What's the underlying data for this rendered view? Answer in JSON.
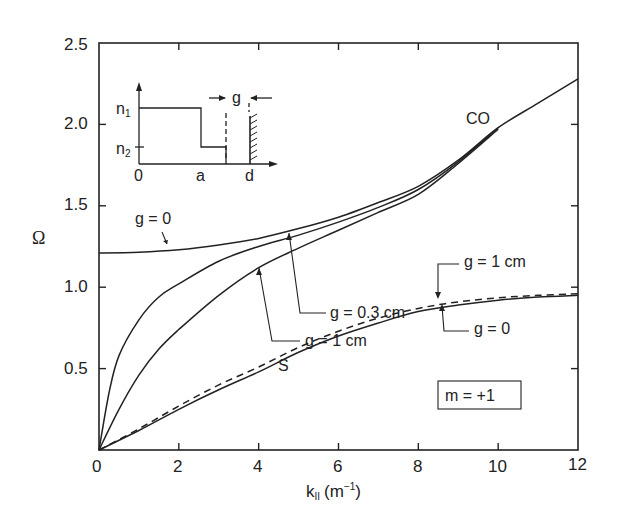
{
  "chart_data": {
    "type": "line",
    "title": "",
    "xlabel": "k∥ (m⁻¹)",
    "ylabel": "Ω",
    "xlim": [
      0,
      12
    ],
    "ylim": [
      0,
      2.5
    ],
    "x_ticks": [
      "0",
      "2",
      "4",
      "6",
      "8",
      "10",
      "12"
    ],
    "y_ticks": [
      "0",
      "0.5",
      "1.0",
      "1.5",
      "2.0",
      "2.5"
    ],
    "grid": false,
    "legend": "none (inline annotations)",
    "series": [
      {
        "name": "CO, g = 0",
        "style": "solid",
        "x": [
          0,
          1,
          2,
          3,
          4,
          5,
          6,
          7,
          8,
          9,
          10,
          11,
          12
        ],
        "y": [
          1.21,
          1.215,
          1.23,
          1.26,
          1.3,
          1.36,
          1.43,
          1.52,
          1.62,
          1.78,
          1.98,
          2.13,
          2.28
        ]
      },
      {
        "name": "CO, g = 0.3 cm",
        "style": "solid",
        "x": [
          0,
          0.25,
          0.5,
          1,
          1.5,
          2,
          3,
          4,
          5,
          6,
          7,
          8,
          9,
          10
        ],
        "y": [
          0,
          0.35,
          0.58,
          0.8,
          0.94,
          1.02,
          1.16,
          1.25,
          1.32,
          1.4,
          1.49,
          1.6,
          1.77,
          1.98
        ]
      },
      {
        "name": "CO, g = 1 cm",
        "style": "solid",
        "x": [
          0,
          0.5,
          1,
          1.5,
          2,
          3,
          4,
          5,
          6,
          7,
          8,
          9,
          10
        ],
        "y": [
          0,
          0.25,
          0.46,
          0.62,
          0.74,
          0.95,
          1.12,
          1.24,
          1.35,
          1.46,
          1.57,
          1.76,
          1.97
        ]
      },
      {
        "name": "S, g = 0",
        "style": "solid",
        "x": [
          0,
          1,
          2,
          3,
          4,
          5,
          6,
          7,
          8,
          9,
          10,
          11,
          12
        ],
        "y": [
          0,
          0.12,
          0.25,
          0.37,
          0.48,
          0.6,
          0.7,
          0.78,
          0.85,
          0.89,
          0.92,
          0.94,
          0.95
        ]
      },
      {
        "name": "S, g = 1 cm",
        "style": "dashed",
        "x": [
          0,
          1,
          2,
          3,
          4,
          5,
          6,
          7,
          8,
          9,
          10,
          11,
          12
        ],
        "y": [
          0,
          0.13,
          0.27,
          0.4,
          0.51,
          0.63,
          0.73,
          0.81,
          0.87,
          0.91,
          0.935,
          0.95,
          0.96
        ]
      }
    ],
    "annotations": [
      "g = 0",
      "g = 0.3 cm",
      "g = 1 cm",
      "g = 1 cm",
      "g = 0",
      "CO",
      "S",
      "m = +1"
    ],
    "inset": {
      "description": "radial density profile",
      "y_labels": [
        "n1",
        "n2"
      ],
      "x_labels": [
        "0",
        "a",
        "d"
      ],
      "gap_label": "g"
    }
  },
  "labels": {
    "y_axis": "Ω",
    "x_axis_main": "k",
    "x_axis_sub": "II",
    "x_axis_unit_open": "(m",
    "x_axis_unit_sup": "−1",
    "x_axis_unit_close": ")",
    "x_ticks": [
      "0",
      "2",
      "4",
      "6",
      "8",
      "10",
      "12"
    ],
    "y_ticks": [
      "0",
      "0.5",
      "1.0",
      "1.5",
      "2.0",
      "2.5"
    ],
    "co_label": "CO",
    "s_label": "S",
    "ann_g0_upper": "g = 0",
    "ann_g03": "g = 0.3 cm",
    "ann_g1_upper": "g = 1 cm",
    "ann_g1_lower": "g = 1 cm",
    "ann_g0_lower": "g = 0",
    "mode_box": "m = +1",
    "inset_n1": "n",
    "inset_n1_sub": "1",
    "inset_n2": "n",
    "inset_n2_sub": "2",
    "inset_x0": "0",
    "inset_xa": "a",
    "inset_xd": "d",
    "inset_gap": "g"
  }
}
